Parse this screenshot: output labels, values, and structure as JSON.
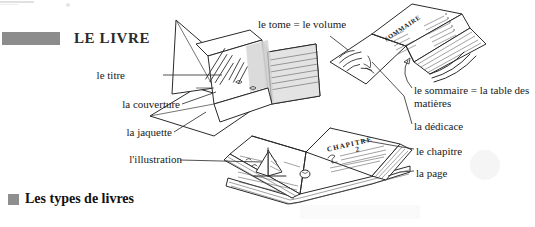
{
  "page": {
    "language": "fr",
    "background_color": "#ffffff",
    "ink_color": "#2a2a2a"
  },
  "header": {
    "rule_color": "#8c8c8c",
    "title": "LE LIVRE"
  },
  "section": {
    "bullet_color": "#8f8f8f",
    "title": "Les types de livres"
  },
  "callouts": {
    "tome": "le tome = le volume",
    "titre": "le titre",
    "couverture": "la couverture",
    "jaquette": "la jaquette",
    "illustration": "l'illustration",
    "sommaire": "le sommaire = la table des matières",
    "dedicace": "la dédicace",
    "chapitre": "le chapitre",
    "page": "la page"
  },
  "illustration": {
    "book_closed_jacket": {
      "name": "closed-book-with-dust-jacket",
      "cover_text": "handwritten-title-lines"
    },
    "book_open_top": {
      "name": "open-book-dedication-and-contents",
      "left_page_text": "handwritten-dedication",
      "right_page_heading": "SOMMAIRE"
    },
    "book_open_bottom": {
      "name": "open-book-chapter",
      "right_page_heading": "CHAPITRE",
      "right_page_number": "2",
      "left_page_figure": "sailboat-illustration"
    }
  }
}
